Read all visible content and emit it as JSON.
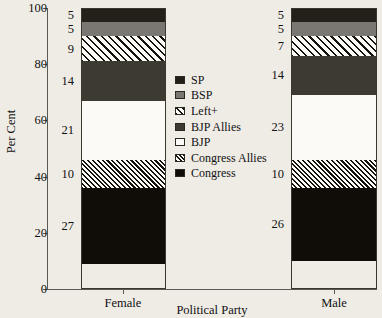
{
  "chart_data": {
    "type": "bar",
    "title": "",
    "xlabel": "Political Party",
    "ylabel": "Per Cent",
    "categories": [
      "Female",
      "Male"
    ],
    "ylim": [
      0,
      100
    ],
    "yticks": [
      0,
      20,
      40,
      60,
      80,
      100
    ],
    "grid": false,
    "stacked": true,
    "stack_order_bottom_to_top": [
      "Congress",
      "Congress Allies",
      "BJP",
      "BJP Allies",
      "Left+",
      "BSP",
      "SP"
    ],
    "legend_position": "center",
    "legend_order_top_to_bottom": [
      "SP",
      "BSP",
      "Left+",
      "BJP Allies",
      "BJP",
      "Congress Allies",
      "Congress"
    ],
    "series": [
      {
        "name": "Congress",
        "fill": "solid-black",
        "color": "#100d08",
        "values": [
          27,
          26
        ]
      },
      {
        "name": "Congress Allies",
        "fill": "dense-hatch",
        "color": "#15120c",
        "values": [
          10,
          10
        ]
      },
      {
        "name": "BJP",
        "fill": "solid-white",
        "color": "#fbfaf7",
        "values": [
          21,
          23
        ]
      },
      {
        "name": "BJP Allies",
        "fill": "solid-dark-gray",
        "color": "#3d3a32",
        "values": [
          14,
          14
        ]
      },
      {
        "name": "Left+",
        "fill": "sparse-hatch",
        "color": "#15120c",
        "values": [
          9,
          7
        ]
      },
      {
        "name": "BSP",
        "fill": "solid-gray",
        "color": "#7a7772",
        "values": [
          5,
          5
        ]
      },
      {
        "name": "SP",
        "fill": "solid-black",
        "color": "#23201a",
        "values": [
          5,
          5
        ]
      }
    ]
  },
  "axis": {
    "y_title": "Per Cent",
    "x_title": "Political Party",
    "y_tick_labels": [
      "0",
      "20",
      "40",
      "60",
      "80",
      "100"
    ],
    "x_tick_labels": [
      "Female",
      "Male"
    ]
  },
  "legend": {
    "items": [
      {
        "label": "SP",
        "swatch": "sw-sp"
      },
      {
        "label": "BSP",
        "swatch": "sw-bsp"
      },
      {
        "label": "Left+",
        "swatch": "sw-left"
      },
      {
        "label": "BJP Allies",
        "swatch": "sw-bjpallies"
      },
      {
        "label": "BJP",
        "swatch": "sw-bjp"
      },
      {
        "label": "Congress Allies",
        "swatch": "sw-congressallies"
      },
      {
        "label": "Congress",
        "swatch": "sw-congress"
      }
    ]
  },
  "bars": {
    "female": {
      "label": "Female",
      "segments": [
        {
          "name": "SP",
          "value": "5",
          "cls": "seg-sp"
        },
        {
          "name": "BSP",
          "value": "5",
          "cls": "seg-bsp"
        },
        {
          "name": "Left+",
          "value": "9",
          "cls": "seg-left"
        },
        {
          "name": "BJP Allies",
          "value": "14",
          "cls": "seg-bjpallies"
        },
        {
          "name": "BJP",
          "value": "21",
          "cls": "seg-bjp"
        },
        {
          "name": "Congress Allies",
          "value": "10",
          "cls": "seg-congressallies"
        },
        {
          "name": "Congress",
          "value": "27",
          "cls": "seg-congress"
        }
      ]
    },
    "male": {
      "label": "Male",
      "segments": [
        {
          "name": "SP",
          "value": "5",
          "cls": "seg-sp"
        },
        {
          "name": "BSP",
          "value": "5",
          "cls": "seg-bsp"
        },
        {
          "name": "Left+",
          "value": "7",
          "cls": "seg-left"
        },
        {
          "name": "BJP Allies",
          "value": "14",
          "cls": "seg-bjpallies"
        },
        {
          "name": "BJP",
          "value": "23",
          "cls": "seg-bjp"
        },
        {
          "name": "Congress Allies",
          "value": "10",
          "cls": "seg-congressallies"
        },
        {
          "name": "Congress",
          "value": "26",
          "cls": "seg-congress"
        }
      ]
    }
  }
}
